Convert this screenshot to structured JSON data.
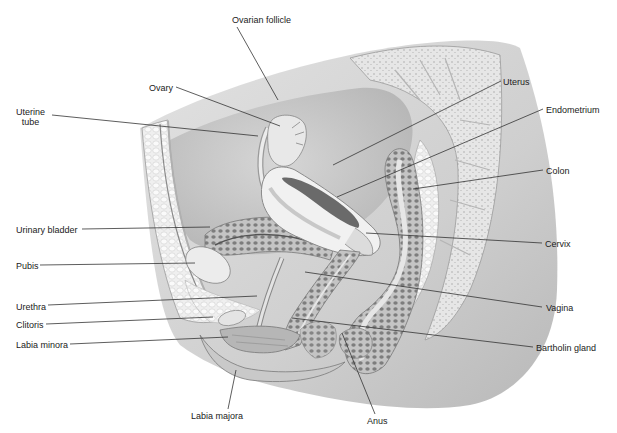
{
  "figure": {
    "type": "anatomical illustration",
    "colors": {
      "background": "#ffffff",
      "ink": "#222222",
      "leader_line": "#333333",
      "tissue_light": "#e9e9e9",
      "tissue_mid": "#c9c9c9",
      "tissue_dark": "#9a9a9a"
    }
  },
  "labels": [
    {
      "id": "ovarian-follicle",
      "text": "Ovarian follicle"
    },
    {
      "id": "ovary",
      "text": "Ovary"
    },
    {
      "id": "uterine-tube",
      "text": "Uterine\ntube"
    },
    {
      "id": "uterus",
      "text": "Uterus"
    },
    {
      "id": "endometrium",
      "text": "Endometrium"
    },
    {
      "id": "colon",
      "text": "Colon"
    },
    {
      "id": "urinary-bladder",
      "text": "Urinary bladder"
    },
    {
      "id": "pubis",
      "text": "Pubis"
    },
    {
      "id": "cervix",
      "text": "Cervix"
    },
    {
      "id": "urethra",
      "text": "Urethra"
    },
    {
      "id": "vagina",
      "text": "Vagina"
    },
    {
      "id": "clitoris",
      "text": "Clitoris"
    },
    {
      "id": "labia-minora",
      "text": "Labia minora"
    },
    {
      "id": "bartholin-gland",
      "text": "Bartholin gland"
    },
    {
      "id": "labia-majora",
      "text": "Labia majora"
    },
    {
      "id": "anus",
      "text": "Anus"
    }
  ]
}
